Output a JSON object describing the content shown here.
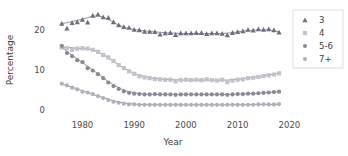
{
  "chart_data": {
    "type": "line",
    "title": "",
    "subtitle": "",
    "xlabel": "Year",
    "ylabel": "Percentage",
    "xlim": [
      1974.5,
      2020.5
    ],
    "ylim": [
      -0.6,
      25.5
    ],
    "xticks": [
      1980,
      1990,
      2000,
      2010,
      2020
    ],
    "xticklabels": [
      "1980",
      "1990",
      "2000",
      "2010",
      "2020"
    ],
    "yticks": [
      0,
      10,
      20
    ],
    "yticklabels": [
      "0",
      "10",
      "20"
    ],
    "grid": false,
    "legend_position": "top-right",
    "x": [
      1976,
      1977,
      1978,
      1979,
      1980,
      1981,
      1982,
      1983,
      1984,
      1985,
      1986,
      1987,
      1988,
      1989,
      1990,
      1991,
      1992,
      1993,
      1994,
      1995,
      1996,
      1997,
      1998,
      1999,
      2000,
      2001,
      2002,
      2003,
      2004,
      2005,
      2006,
      2007,
      2008,
      2009,
      2010,
      2011,
      2012,
      2013,
      2014,
      2015,
      2016,
      2017,
      2018
    ],
    "series": [
      {
        "name": "3",
        "marker": "triangle",
        "color": "#6e6e7d",
        "values": [
          21.6,
          20.4,
          21.8,
          22.0,
          22.6,
          21.9,
          23.6,
          23.9,
          23.2,
          23.1,
          22.0,
          21.2,
          20.8,
          20.6,
          20.1,
          20.0,
          19.6,
          19.6,
          19.5,
          18.9,
          19.2,
          19.3,
          18.8,
          19.2,
          19.2,
          19.2,
          19.3,
          19.3,
          19.0,
          19.2,
          19.2,
          19.1,
          18.7,
          19.3,
          19.5,
          19.7,
          20.1,
          19.9,
          20.2,
          20.1,
          20.2,
          20.0,
          19.4
        ],
        "fitted": [
          21.6,
          21.8,
          22.1,
          22.4,
          22.7,
          23.1,
          23.4,
          23.5,
          23.2,
          22.6,
          21.9,
          21.2,
          20.7,
          20.3,
          20.1,
          19.9,
          19.8,
          19.6,
          19.5,
          19.4,
          19.3,
          19.2,
          19.2,
          19.1,
          19.1,
          19.1,
          19.1,
          19.1,
          19.1,
          19.1,
          19.1,
          19.1,
          19.2,
          19.3,
          19.5,
          19.7,
          19.8,
          19.9,
          20.0,
          20.0,
          20.0,
          19.8,
          19.5
        ]
      },
      {
        "name": "4",
        "marker": "square",
        "color": "#c2c2cb",
        "values": [
          15.6,
          15.4,
          15.0,
          15.3,
          15.4,
          15.3,
          15.0,
          14.5,
          13.7,
          13.1,
          12.2,
          11.2,
          10.4,
          9.6,
          9.0,
          8.4,
          8.1,
          7.9,
          7.7,
          7.6,
          7.5,
          7.5,
          7.1,
          7.4,
          7.5,
          7.4,
          7.5,
          7.4,
          7.6,
          7.4,
          7.3,
          7.5,
          6.9,
          7.3,
          7.5,
          7.6,
          7.9,
          8.0,
          8.2,
          8.4,
          8.6,
          8.8,
          9.1
        ],
        "fitted": [
          15.7,
          15.6,
          15.5,
          15.4,
          15.3,
          15.2,
          15.0,
          14.5,
          13.8,
          13.0,
          12.1,
          11.2,
          10.4,
          9.7,
          9.1,
          8.6,
          8.3,
          8.0,
          7.8,
          7.7,
          7.6,
          7.5,
          7.5,
          7.4,
          7.4,
          7.4,
          7.4,
          7.4,
          7.4,
          7.4,
          7.4,
          7.4,
          7.4,
          7.5,
          7.6,
          7.8,
          7.9,
          8.1,
          8.3,
          8.5,
          8.7,
          8.9,
          9.1
        ]
      },
      {
        "name": "5-6",
        "marker": "circle",
        "color": "#8a8a95",
        "values": [
          16.0,
          14.2,
          13.4,
          12.4,
          11.9,
          10.4,
          9.8,
          8.9,
          7.9,
          6.8,
          5.9,
          5.2,
          4.6,
          4.2,
          4.0,
          3.9,
          3.8,
          3.8,
          3.9,
          3.8,
          3.8,
          3.8,
          3.7,
          3.8,
          3.8,
          3.8,
          3.8,
          3.8,
          3.8,
          3.8,
          3.8,
          3.8,
          3.7,
          3.8,
          3.9,
          3.9,
          4.0,
          4.0,
          4.1,
          4.2,
          4.3,
          4.4,
          4.5
        ],
        "fitted": [
          15.8,
          14.6,
          13.6,
          12.7,
          11.8,
          10.9,
          9.9,
          9.0,
          8.0,
          7.0,
          6.2,
          5.5,
          4.9,
          4.5,
          4.2,
          4.0,
          3.9,
          3.8,
          3.8,
          3.8,
          3.8,
          3.8,
          3.8,
          3.8,
          3.8,
          3.8,
          3.8,
          3.8,
          3.8,
          3.8,
          3.8,
          3.8,
          3.8,
          3.8,
          3.9,
          3.9,
          4.0,
          4.0,
          4.1,
          4.2,
          4.3,
          4.4,
          4.5
        ]
      },
      {
        "name": "7+",
        "marker": "circle",
        "color": "#b0b0ba",
        "values": [
          6.5,
          6.1,
          5.5,
          5.1,
          4.5,
          4.3,
          3.9,
          3.4,
          2.9,
          2.4,
          2.0,
          1.7,
          1.5,
          1.3,
          1.3,
          1.2,
          1.2,
          1.2,
          1.2,
          1.2,
          1.2,
          1.2,
          1.2,
          1.2,
          1.2,
          1.2,
          1.2,
          1.2,
          1.2,
          1.2,
          1.2,
          1.2,
          1.2,
          1.2,
          1.2,
          1.2,
          1.2,
          1.2,
          1.3,
          1.3,
          1.3,
          1.3,
          1.4
        ],
        "fitted": [
          6.4,
          6.0,
          5.6,
          5.2,
          4.7,
          4.3,
          3.8,
          3.4,
          3.0,
          2.6,
          2.2,
          1.9,
          1.7,
          1.5,
          1.4,
          1.3,
          1.3,
          1.2,
          1.2,
          1.2,
          1.2,
          1.2,
          1.2,
          1.2,
          1.2,
          1.2,
          1.2,
          1.2,
          1.2,
          1.2,
          1.2,
          1.2,
          1.2,
          1.2,
          1.2,
          1.2,
          1.2,
          1.3,
          1.3,
          1.3,
          1.3,
          1.3,
          1.4
        ]
      }
    ]
  },
  "legend": {
    "items": [
      {
        "label": "3",
        "marker": "triangle-icon"
      },
      {
        "label": "4",
        "marker": "square-icon"
      },
      {
        "label": "5-6",
        "marker": "circle-icon"
      },
      {
        "label": "7+",
        "marker": "circle-icon"
      }
    ]
  },
  "axes": {
    "x_title": "Year",
    "y_title": "Percentage"
  }
}
